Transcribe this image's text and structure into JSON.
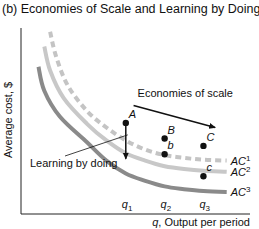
{
  "chart_data": {
    "type": "line",
    "title": "(b) Economies of Scale and Learning by Doing",
    "xlabel_var": "q",
    "xlabel": ", Output per period",
    "ylabel": "Average cost, $",
    "x_ticks": [
      {
        "label": "q",
        "sub": "1",
        "x": 1
      },
      {
        "label": "q",
        "sub": "2",
        "x": 2
      },
      {
        "label": "q",
        "sub": "3",
        "x": 3
      }
    ],
    "xlim": [
      -1.7,
      4.2
    ],
    "ylim": [
      0,
      10
    ],
    "grid": false,
    "series": [
      {
        "name": "AC",
        "sup": "1",
        "style": "dashed",
        "color": "#c4c4c4",
        "points": [
          [
            -0.95,
            9.9
          ],
          [
            -0.8,
            8.6
          ],
          [
            -0.5,
            7.0
          ],
          [
            0,
            5.6
          ],
          [
            0.5,
            4.7
          ],
          [
            1,
            4.0
          ],
          [
            1.5,
            3.5
          ],
          [
            2,
            3.2
          ],
          [
            2.5,
            3.05
          ],
          [
            3,
            2.95
          ],
          [
            3.6,
            2.9
          ]
        ]
      },
      {
        "name": "AC",
        "sup": "2",
        "style": "solid",
        "color": "#c8c8c8",
        "points": [
          [
            -1.1,
            9.1
          ],
          [
            -0.95,
            7.8
          ],
          [
            -0.6,
            6.3
          ],
          [
            0,
            4.9
          ],
          [
            0.5,
            4.0
          ],
          [
            1,
            3.3
          ],
          [
            1.5,
            2.9
          ],
          [
            2,
            2.6
          ],
          [
            2.5,
            2.45
          ],
          [
            3,
            2.35
          ],
          [
            3.6,
            2.3
          ]
        ]
      },
      {
        "name": "AC",
        "sup": "3",
        "style": "solid",
        "color": "#8a8a8a",
        "points": [
          [
            -1.25,
            8.0
          ],
          [
            -1.1,
            6.7
          ],
          [
            -0.7,
            5.3
          ],
          [
            0,
            3.9
          ],
          [
            0.5,
            2.9
          ],
          [
            1,
            2.2
          ],
          [
            1.5,
            1.8
          ],
          [
            2,
            1.5
          ],
          [
            2.5,
            1.35
          ],
          [
            3,
            1.25
          ],
          [
            3.6,
            1.2
          ]
        ]
      }
    ],
    "points": [
      {
        "label": "A",
        "x": 1,
        "y": 4.95,
        "on": "AC1"
      },
      {
        "label": "B",
        "x": 2,
        "y": 4.1,
        "on": "AC1"
      },
      {
        "label": "C",
        "x": 3,
        "y": 3.7,
        "on": "AC1"
      },
      {
        "label": "b",
        "x": 2,
        "y": 3.25,
        "on": "AC2"
      },
      {
        "label": "c",
        "x": 3,
        "y": 2.05,
        "on": "AC3"
      }
    ],
    "annotations": [
      {
        "text": "Economies of scale",
        "type": "arrow",
        "from": [
          1.2,
          5.9
        ],
        "to": [
          3.3,
          4.7
        ]
      },
      {
        "text": "Learning by doing",
        "type": "arrow",
        "from": [
          1,
          4.95
        ],
        "to": [
          1,
          3.0
        ]
      }
    ]
  }
}
